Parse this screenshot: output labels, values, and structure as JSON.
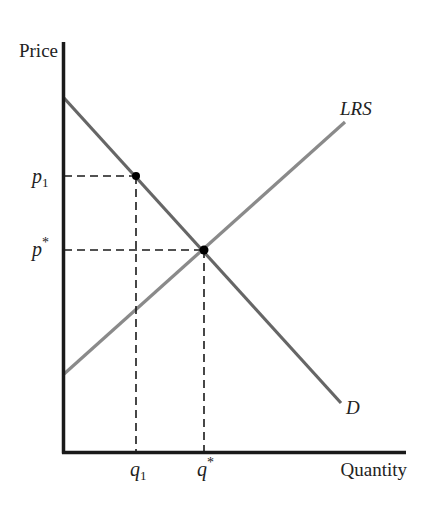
{
  "axes": {
    "y_label": "Price",
    "x_label": "Quantity"
  },
  "curves": {
    "demand": {
      "label": "D",
      "color": "#666666"
    },
    "supply": {
      "label": "LRS",
      "color": "#8a8a8a"
    }
  },
  "points": {
    "initial": {
      "price_label": "p",
      "price_sub": "1",
      "qty_label": "q",
      "qty_sub": "1"
    },
    "equilibrium": {
      "price_label": "p",
      "price_sup": "*",
      "qty_label": "q",
      "qty_sup": "*"
    }
  },
  "colors": {
    "axis": "#1a1a1a",
    "dash": "#1a1a1a",
    "point": "#000000"
  }
}
